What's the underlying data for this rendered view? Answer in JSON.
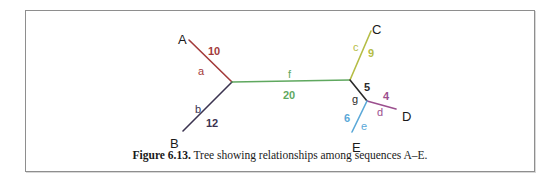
{
  "figure": {
    "caption_label": "Figure 6.13.",
    "caption_text": " Tree showing relationships among sequences A–E."
  },
  "colors": {
    "branch_a": "#a33a3a",
    "branch_b": "#3b3350",
    "branch_c": "#b5bd45",
    "branch_d": "#9b4f8e",
    "branch_e": "#5aa8d8",
    "branch_f": "#5fa85f",
    "branch_g": "#2a2a2a",
    "taxon_label": "#1a1a1a",
    "box_border": "#8e8e8e",
    "background": "#ffffff"
  },
  "chart_data": {
    "type": "diagram",
    "title": "Tree showing relationships among sequences A–E",
    "taxa": [
      {
        "name": "A",
        "x": 178,
        "y": 33
      },
      {
        "name": "B",
        "x": 170,
        "y": 137
      },
      {
        "name": "C",
        "x": 372,
        "y": 23
      },
      {
        "name": "D",
        "x": 402,
        "y": 110
      },
      {
        "name": "E",
        "x": 352,
        "y": 141
      }
    ],
    "internal_nodes": [
      {
        "id": "n1",
        "x": 232,
        "y": 82
      },
      {
        "id": "n2",
        "x": 350,
        "y": 80
      },
      {
        "id": "n3",
        "x": 367,
        "y": 101
      }
    ],
    "branches": [
      {
        "id": "a",
        "label": "a",
        "length": "10",
        "color": "#a33a3a",
        "from": "A",
        "to": "n1",
        "x1": 189,
        "y1": 40,
        "x2": 232,
        "y2": 82
      },
      {
        "id": "b",
        "label": "b",
        "length": "12",
        "color": "#3b3350",
        "from": "B",
        "to": "n1",
        "x1": 183,
        "y1": 131,
        "x2": 232,
        "y2": 82
      },
      {
        "id": "f",
        "label": "f",
        "length": "20",
        "color": "#5fa85f",
        "from": "n1",
        "to": "n2",
        "x1": 232,
        "y1": 82,
        "x2": 350,
        "y2": 80
      },
      {
        "id": "c",
        "label": "c",
        "length": "9",
        "color": "#b5bd45",
        "from": "C",
        "to": "n2",
        "x1": 371,
        "y1": 31,
        "x2": 350,
        "y2": 80
      },
      {
        "id": "g",
        "label": "g",
        "length": "5",
        "color": "#2a2a2a",
        "from": "n2",
        "to": "n3",
        "x1": 350,
        "y1": 80,
        "x2": 367,
        "y2": 101
      },
      {
        "id": "d",
        "label": "d",
        "length": "4",
        "color": "#9b4f8e",
        "from": "n3",
        "to": "D",
        "x1": 367,
        "y1": 101,
        "x2": 396,
        "y2": 109
      },
      {
        "id": "e",
        "label": "e",
        "length": "6",
        "color": "#5aa8d8",
        "from": "n3",
        "to": "E",
        "x1": 367,
        "y1": 101,
        "x2": 352,
        "y2": 132
      }
    ],
    "edge_labels": [
      {
        "id": "a-num",
        "text": "10",
        "color": "#a33a3a",
        "x": 208,
        "y": 46,
        "bold": true
      },
      {
        "id": "a-name",
        "text": "a",
        "color": "#a33a3a",
        "x": 198,
        "y": 66,
        "bold": false
      },
      {
        "id": "b-name",
        "text": "b",
        "color": "#3b3350",
        "x": 195,
        "y": 104,
        "bold": false
      },
      {
        "id": "b-num",
        "text": "12",
        "color": "#3b3350",
        "x": 206,
        "y": 118,
        "bold": true
      },
      {
        "id": "f-name",
        "text": "f",
        "color": "#5fa85f",
        "x": 288,
        "y": 69,
        "bold": false
      },
      {
        "id": "f-num",
        "text": "20",
        "color": "#5fa85f",
        "x": 283,
        "y": 90,
        "bold": true
      },
      {
        "id": "c-name",
        "text": "c",
        "color": "#b5bd45",
        "x": 353,
        "y": 42,
        "bold": false
      },
      {
        "id": "c-num",
        "text": "9",
        "color": "#b5bd45",
        "x": 368,
        "y": 48,
        "bold": true
      },
      {
        "id": "g-num",
        "text": "5",
        "color": "#2a2a2a",
        "x": 364,
        "y": 82,
        "bold": true
      },
      {
        "id": "g-name",
        "text": "g",
        "color": "#2a2a2a",
        "x": 352,
        "y": 94,
        "bold": false
      },
      {
        "id": "d-num",
        "text": "4",
        "color": "#9b4f8e",
        "x": 383,
        "y": 91,
        "bold": true
      },
      {
        "id": "d-name",
        "text": "d",
        "color": "#9b4f8e",
        "x": 377,
        "y": 107,
        "bold": false
      },
      {
        "id": "e-num",
        "text": "6",
        "color": "#5aa8d8",
        "x": 344,
        "y": 113,
        "bold": true
      },
      {
        "id": "e-name",
        "text": "e",
        "color": "#5aa8d8",
        "x": 361,
        "y": 121,
        "bold": false
      }
    ]
  }
}
